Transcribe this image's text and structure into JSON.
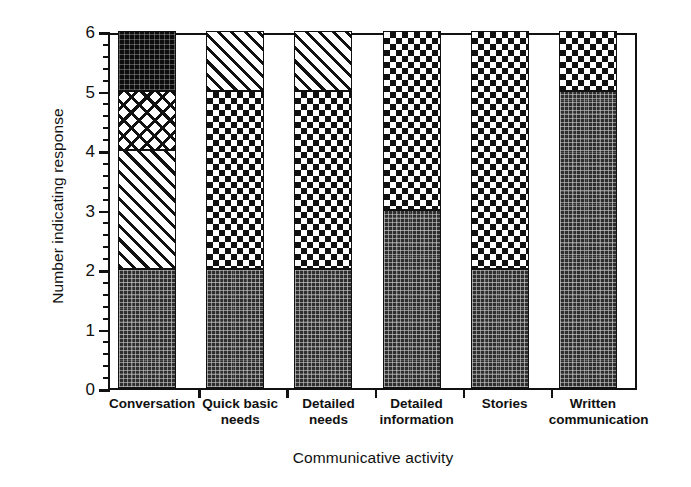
{
  "chart_data": {
    "type": "bar",
    "stacked": true,
    "title": "",
    "xlabel": "Communicative activity",
    "ylabel": "Number indicating response",
    "ylim": [
      0,
      6
    ],
    "ytick_labels": [
      "0",
      "1",
      "2",
      "3",
      "4",
      "5",
      "6"
    ],
    "ytick_values": [
      0,
      1,
      2,
      3,
      4,
      5,
      6
    ],
    "minor_ticks_between_majors": 4,
    "grid": false,
    "legend": null,
    "categories": [
      "Conversation",
      "Quick basic needs",
      "Detailed needs",
      "Detailed information",
      "Stories",
      "Written communication"
    ],
    "category_lines": [
      [
        "Conversation"
      ],
      [
        "Quick basic",
        "needs"
      ],
      [
        "Detailed",
        "needs"
      ],
      [
        "Detailed",
        "information"
      ],
      [
        "Stories"
      ],
      [
        "Written",
        "communication"
      ]
    ],
    "series": [
      {
        "name": "stipple-dark",
        "pattern": "dense-dark-stipple",
        "values": [
          2,
          2,
          2,
          3,
          2,
          5
        ]
      },
      {
        "name": "hatch",
        "pattern": "diagonal-hatch",
        "values": [
          2,
          0,
          0,
          0,
          0,
          0
        ]
      },
      {
        "name": "crosshatch",
        "pattern": "diagonal-crosshatch",
        "values": [
          1,
          0,
          0,
          0,
          0,
          0
        ]
      },
      {
        "name": "dotted-black",
        "pattern": "fine-dotted-black",
        "values": [
          1,
          0,
          0,
          0,
          0,
          0
        ]
      },
      {
        "name": "checker",
        "pattern": "checkerboard",
        "values": [
          0,
          3,
          3,
          3,
          4,
          1
        ]
      },
      {
        "name": "hatch-top",
        "pattern": "diagonal-hatch",
        "values": [
          0,
          1,
          1,
          0,
          0,
          0
        ]
      }
    ],
    "bar_segments": [
      [
        {
          "from": 0,
          "to": 2,
          "fill": "stipple-dark"
        },
        {
          "from": 2,
          "to": 4,
          "fill": "hatch"
        },
        {
          "from": 4,
          "to": 5,
          "fill": "crosshatch"
        },
        {
          "from": 5,
          "to": 6,
          "fill": "dotted-black"
        }
      ],
      [
        {
          "from": 0,
          "to": 2,
          "fill": "stipple-dark"
        },
        {
          "from": 2,
          "to": 5,
          "fill": "checker"
        },
        {
          "from": 5,
          "to": 6,
          "fill": "hatch"
        }
      ],
      [
        {
          "from": 0,
          "to": 2,
          "fill": "stipple-dark"
        },
        {
          "from": 2,
          "to": 5,
          "fill": "checker"
        },
        {
          "from": 5,
          "to": 6,
          "fill": "hatch"
        }
      ],
      [
        {
          "from": 0,
          "to": 3,
          "fill": "stipple-dark"
        },
        {
          "from": 3,
          "to": 6,
          "fill": "checker"
        }
      ],
      [
        {
          "from": 0,
          "to": 2,
          "fill": "stipple-dark"
        },
        {
          "from": 2,
          "to": 6,
          "fill": "checker"
        }
      ],
      [
        {
          "from": 0,
          "to": 5,
          "fill": "stipple-dark"
        },
        {
          "from": 5,
          "to": 6,
          "fill": "checker"
        }
      ]
    ],
    "totals": [
      6,
      6,
      6,
      6,
      6,
      6
    ]
  },
  "colors": {
    "ink": "#111111",
    "paper": "#ffffff"
  }
}
